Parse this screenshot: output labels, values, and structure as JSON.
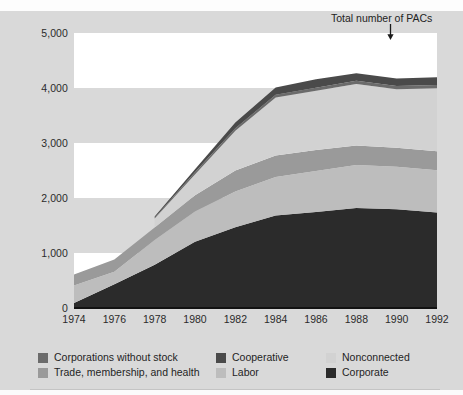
{
  "caption_sliver": "",
  "annotation": {
    "text": "Total number of PACs",
    "arrow_icon": "down-arrow-icon",
    "points_at_year": 1990
  },
  "axes": {
    "y_ticks": [
      "0",
      "1,000",
      "2,000",
      "3,000",
      "4,000",
      "5,000"
    ],
    "x_ticks": [
      "1974",
      "1976",
      "1978",
      "1980",
      "1982",
      "1984",
      "1986",
      "1988",
      "1990",
      "1992"
    ]
  },
  "legend": {
    "items": [
      {
        "label": "Corporations without stock",
        "color": "#6b6b6b",
        "col": 0,
        "row": 0
      },
      {
        "label": "Trade, membership, and health",
        "color": "#9a9a9a",
        "col": 0,
        "row": 1
      },
      {
        "label": "Cooperative",
        "color": "#4a4a4a",
        "col": 1,
        "row": 0
      },
      {
        "label": "Labor",
        "color": "#bdbdbd",
        "col": 1,
        "row": 1
      },
      {
        "label": "Nonconnected",
        "color": "#d2d2d2",
        "col": 2,
        "row": 0
      },
      {
        "label": "Corporate",
        "color": "#2b2b2b",
        "col": 2,
        "row": 1
      }
    ]
  },
  "chart_data": {
    "type": "area",
    "title": "Total number of PACs",
    "xlabel": "",
    "ylabel": "",
    "stacked": true,
    "grid": "horizontal-banded",
    "legend_position": "bottom",
    "xlim": [
      1974,
      1992
    ],
    "ylim": [
      0,
      5000
    ],
    "x": [
      1974,
      1976,
      1978,
      1980,
      1982,
      1984,
      1986,
      1988,
      1990,
      1992
    ],
    "series": [
      {
        "name": "Corporate",
        "color": "#2b2b2b",
        "values": [
          89,
          433,
          785,
          1204,
          1469,
          1682,
          1744,
          1816,
          1795,
          1735
        ]
      },
      {
        "name": "Trade, membership, and health",
        "color": "#bdbdbd",
        "values": [
          318,
          224,
          453,
          551,
          649,
          698,
          745,
          786,
          774,
          770
        ]
      },
      {
        "name": "Labor",
        "color": "#9a9a9a",
        "values": [
          201,
          224,
          224,
          297,
          380,
          394,
          384,
          354,
          346,
          347
        ]
      },
      {
        "name": "Nonconnected",
        "color": "#d2d2d2",
        "values": [
          0,
          0,
          165,
          374,
          723,
          1053,
          1077,
          1115,
          1062,
          1145
        ]
      },
      {
        "name": "Cooperative",
        "color": "#6b6b6b",
        "values": [
          0,
          0,
          12,
          42,
          47,
          52,
          56,
          59,
          59,
          56
        ]
      },
      {
        "name": "Corporations without stock",
        "color": "#4a4a4a",
        "values": [
          0,
          0,
          24,
          56,
          103,
          130,
          151,
          138,
          136,
          142
        ]
      }
    ],
    "totals": [
      608,
      881,
      1653,
      2551,
      3371,
      4009,
      4157,
      4268,
      4172,
      4195
    ]
  }
}
